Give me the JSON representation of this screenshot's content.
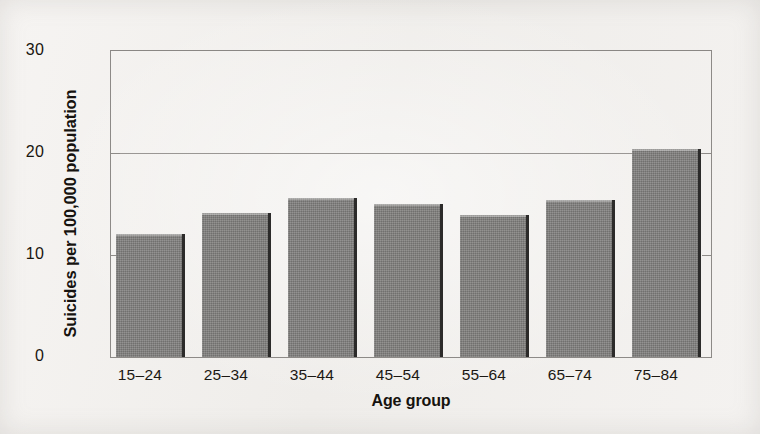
{
  "chart_data": {
    "type": "bar",
    "title": "",
    "xlabel": "Age group",
    "ylabel": "Suicides per 100,000 population",
    "categories": [
      "15–24",
      "25–34",
      "35–44",
      "45–54",
      "55–64",
      "65–74",
      "75–84"
    ],
    "values": [
      12.1,
      14.1,
      15.6,
      15.0,
      13.9,
      15.4,
      20.4
    ],
    "ylim": [
      0,
      30
    ],
    "yticks": [
      0,
      10,
      20,
      30
    ],
    "ytick_labels": [
      "0",
      "10",
      "20",
      "30"
    ],
    "grid": "horizontal gridlines at 20 and 30 (frame top); tick marks at 10 and 20",
    "legend": "none",
    "bar_color": "#7c7b79",
    "bar_edge_color": "#2c2b2a",
    "plot_frame_color": "#8d8a87",
    "background_color": "#f3f1ef",
    "text_color": "#16130f"
  }
}
